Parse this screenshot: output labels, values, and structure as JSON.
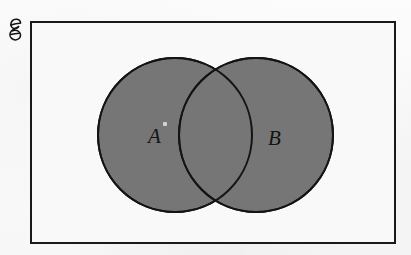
{
  "diagram": {
    "type": "venn",
    "universal_set": {
      "symbol": "ℰ",
      "name": "script-capital-e",
      "meaning": "universal set",
      "border_color": "#1a1a1a",
      "fill_color": "#f9f9f9",
      "border_width_px": 2,
      "bounds": {
        "x": 30,
        "y": 21,
        "width": 366,
        "height": 223
      }
    },
    "sets": [
      {
        "label": "A",
        "name": "set-a",
        "shape": "circle",
        "center_x": 175,
        "center_y": 135,
        "radius": 77,
        "fill_color": "#767676",
        "stroke_color": "#141414",
        "stroke_width_px": 2,
        "shaded": true,
        "label_x": 155,
        "label_y": 138
      },
      {
        "label": "B",
        "name": "set-b",
        "shape": "circle",
        "center_x": 256,
        "center_y": 135,
        "radius": 77,
        "fill_color": "#767676",
        "stroke_color": "#141414",
        "stroke_width_px": 2,
        "shaded": true,
        "label_x": 275,
        "label_y": 140
      }
    ],
    "intersection": {
      "name": "a-intersect-b",
      "shaded": true,
      "fill_color": "#767676",
      "note": "overlap lens rendered in the same gray as both circles"
    },
    "background_color": "#fafafa",
    "page_background": "#ffffff"
  }
}
